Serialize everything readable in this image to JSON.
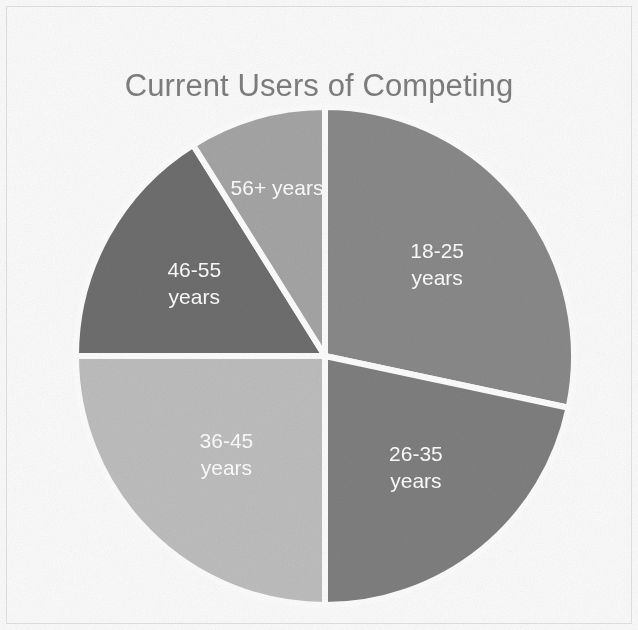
{
  "chart_data": {
    "type": "pie",
    "title": "Current Users of Competing Product (Chart 2)",
    "title_line1": "Current Users of Competing",
    "title_line2": "Product (Chart 2)",
    "xlabel": "",
    "ylabel": "",
    "legend": "none",
    "labels_inside_slices": true,
    "start_angle_deg": 0,
    "direction": "clockwise",
    "categories": [
      "18-25 years",
      "26-35 years",
      "36-45 years",
      "46-55 years",
      "56+ years"
    ],
    "values": [
      28.5,
      21.5,
      25,
      16,
      9
    ],
    "unit": "percent",
    "slices": [
      {
        "label": "18-25 years",
        "label_line1": "18-25",
        "label_line2": "years",
        "value": 28.5,
        "start_angle_deg": 0,
        "end_angle_deg": 102,
        "color": "#8a8a8a"
      },
      {
        "label": "26-35 years",
        "label_line1": "26-35",
        "label_line2": "years",
        "value": 21.5,
        "start_angle_deg": 102,
        "end_angle_deg": 180,
        "color": "#808080"
      },
      {
        "label": "36-45 years",
        "label_line1": "36-45",
        "label_line2": "years",
        "value": 25,
        "start_angle_deg": 180,
        "end_angle_deg": 270,
        "color": "#bfbfbf"
      },
      {
        "label": "46-55 years",
        "label_line1": "46-55",
        "label_line2": "years",
        "value": 16,
        "start_angle_deg": 270,
        "end_angle_deg": 328,
        "color": "#6f6f6f"
      },
      {
        "label": "56+ years",
        "label_line1": "56+ years",
        "label_line2": "",
        "value": 9,
        "start_angle_deg": 328,
        "end_angle_deg": 360,
        "color": "#a6a6a6"
      }
    ],
    "colors": {
      "title_text": "#7f7f7f",
      "slice_label_text": "#ffffff",
      "slice_separator": "#ffffff",
      "background": "#fdfdfd"
    }
  }
}
